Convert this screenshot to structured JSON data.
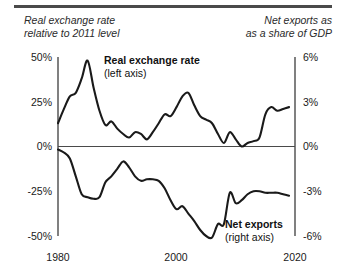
{
  "header": {
    "left": "Real exchange rate\nrelative to 2011 level",
    "right": "Net exports as\nas a share of GDP"
  },
  "series_labels": {
    "upper_name": "Real exchange rate",
    "upper_axis": "(left axis)",
    "lower_name": "Net exports",
    "lower_axis": "(right axis)"
  },
  "colors": {
    "line": "#1a1a1a",
    "axis": "#4a4a4a",
    "rule": "#4a4a4a",
    "text": "#1a1a1a"
  },
  "chart_data": {
    "type": "line",
    "title": "",
    "subtitle": "",
    "xlabel": "",
    "ylabel": "Real exchange rate relative to 2011 level",
    "y2label": "Net exports as as a share of GDP",
    "grid": false,
    "legend": "inline-annotations",
    "xlim": [
      1980,
      2020
    ],
    "xticks": [
      1980,
      2000,
      2020
    ],
    "xticklabels": [
      "1980",
      "2000",
      "2020"
    ],
    "ylim": [
      -50,
      50
    ],
    "yticks": [
      50,
      25,
      0,
      -25,
      -50
    ],
    "yticklabels": [
      "50%",
      "25%",
      "0%",
      "-25%",
      "-50%"
    ],
    "y2lim": [
      -6,
      6
    ],
    "y2ticks": [
      6,
      3,
      0,
      -3,
      -6
    ],
    "y2ticklabels": [
      "6%",
      "3%",
      "0%",
      "-3%",
      "-6%"
    ],
    "series": [
      {
        "name": "Real exchange rate",
        "axis": "left",
        "units": "percent relative to 2011 level",
        "x": [
          1980,
          1981,
          1982,
          1983,
          1984,
          1985,
          1986,
          1987,
          1988,
          1989,
          1990,
          1991,
          1992,
          1993,
          1994,
          1995,
          1996,
          1997,
          1998,
          1999,
          2000,
          2001,
          2002,
          2003,
          2004,
          2005,
          2006,
          2007,
          2008,
          2009,
          2010,
          2011,
          2012,
          2013,
          2014,
          2015,
          2016,
          2017,
          2018,
          2019
        ],
        "values": [
          13,
          21,
          28,
          30,
          38,
          48,
          33,
          20,
          12,
          14,
          10,
          7,
          5,
          8,
          7,
          4,
          8,
          13,
          18,
          17,
          22,
          28,
          30,
          23,
          17,
          15,
          13,
          7,
          2,
          8,
          4,
          0,
          2,
          3,
          5,
          18,
          22,
          20,
          21,
          22
        ]
      },
      {
        "name": "Net exports",
        "axis": "right",
        "units": "percent of GDP",
        "x": [
          1980,
          1981,
          1982,
          1983,
          1984,
          1985,
          1986,
          1987,
          1988,
          1989,
          1990,
          1991,
          1992,
          1993,
          1994,
          1995,
          1996,
          1997,
          1998,
          1999,
          2000,
          2001,
          2002,
          2003,
          2004,
          2005,
          2006,
          2007,
          2008,
          2009,
          2010,
          2011,
          2012,
          2013,
          2014,
          2015,
          2016,
          2017,
          2018,
          2019
        ],
        "values": [
          -0.2,
          -0.4,
          -0.8,
          -2.0,
          -3.2,
          -3.4,
          -3.5,
          -3.4,
          -2.4,
          -2.0,
          -1.5,
          -1.0,
          -1.4,
          -2.0,
          -2.3,
          -2.2,
          -2.2,
          -2.3,
          -2.8,
          -3.6,
          -4.2,
          -4.0,
          -4.5,
          -5.0,
          -5.6,
          -6.0,
          -6.1,
          -5.2,
          -5.2,
          -3.1,
          -3.8,
          -3.6,
          -3.2,
          -3.0,
          -3.0,
          -3.1,
          -3.1,
          -3.1,
          -3.2,
          -3.3
        ]
      }
    ]
  }
}
